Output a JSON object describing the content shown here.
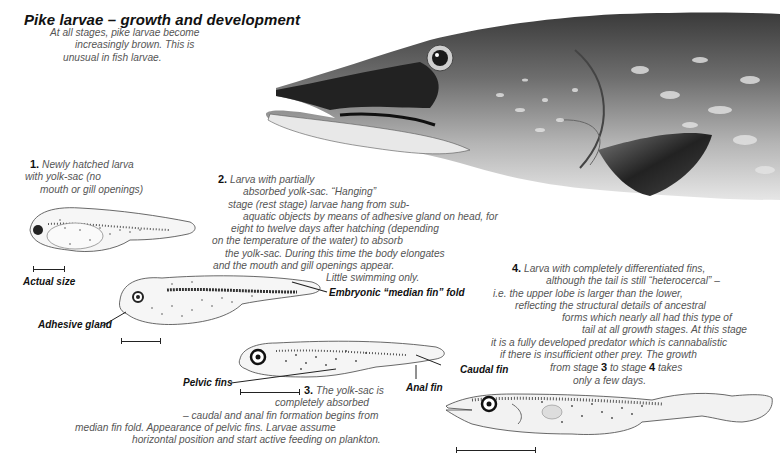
{
  "title": "Pike larvae – growth and development",
  "intro": {
    "lines": [
      "At all stages, pike larvae become",
      "increasingly brown. This is",
      "unusual in fish larvae."
    ]
  },
  "stage1": {
    "number": "1.",
    "lines": [
      "Newly hatched larva",
      "with yolk-sac (no",
      "mouth or gill openings)"
    ],
    "scale_label": "Actual size"
  },
  "stage2": {
    "number": "2.",
    "lines": [
      "Larva with partially",
      "absorbed yolk-sac. “Hanging”",
      "stage (rest stage) larvae hang from sub-",
      "aquatic objects by means of adhesive gland on head, for",
      "eight to twelve days after hatching (depending",
      "on the temperature of the water) to absorb",
      "the yolk-sac. During this time the body elongates",
      "and the mouth and gill openings appear.",
      "Little swimming only."
    ],
    "labels": {
      "median_fin": "Embryonic “median fin” fold",
      "adhesive_gland": "Adhesive gland"
    }
  },
  "stage3": {
    "number": "3.",
    "lines": [
      "The yolk-sac is",
      "completely absorbed",
      "– caudal and anal fin formation begins from",
      "median fin fold. Appearance of pelvic fins. Larvae assume",
      "horizontal position and start active feeding on plankton."
    ],
    "labels": {
      "pelvic_fins": "Pelvic fins",
      "anal_fin": "Anal fin",
      "caudal_fin": "Caudal fin"
    }
  },
  "stage4": {
    "number": "4.",
    "lines": [
      "Larva with completely differentiated fins,",
      "although the tail is still “heterocercal” –",
      "i.e. the upper lobe is larger than the lower,",
      "reflecting the structural details of ancestral",
      "forms which nearly all had this type of",
      "tail at all growth stages. At this stage",
      "it is a fully developed predator which is cannabalistic",
      "if there is insufficient other prey. The growth",
      "only a few days."
    ],
    "growth_line": {
      "pre": "from stage ",
      "from": "3",
      "mid": " to stage ",
      "to": "4",
      "post": " takes"
    }
  },
  "illustrations": {
    "adult_head": "adult-pike-head-illustration",
    "larva1": "stage-1-larva-illustration",
    "larva2": "stage-2-larva-illustration",
    "larva3": "stage-3-larva-illustration",
    "larva4": "stage-4-larva-illustration"
  },
  "colors": {
    "background": "#ffffff",
    "title": "#111111",
    "body_text": "#555555",
    "pike_dark": "#2b2b2b",
    "pike_mid": "#8a8a8a",
    "pike_light": "#d8d8d8"
  }
}
